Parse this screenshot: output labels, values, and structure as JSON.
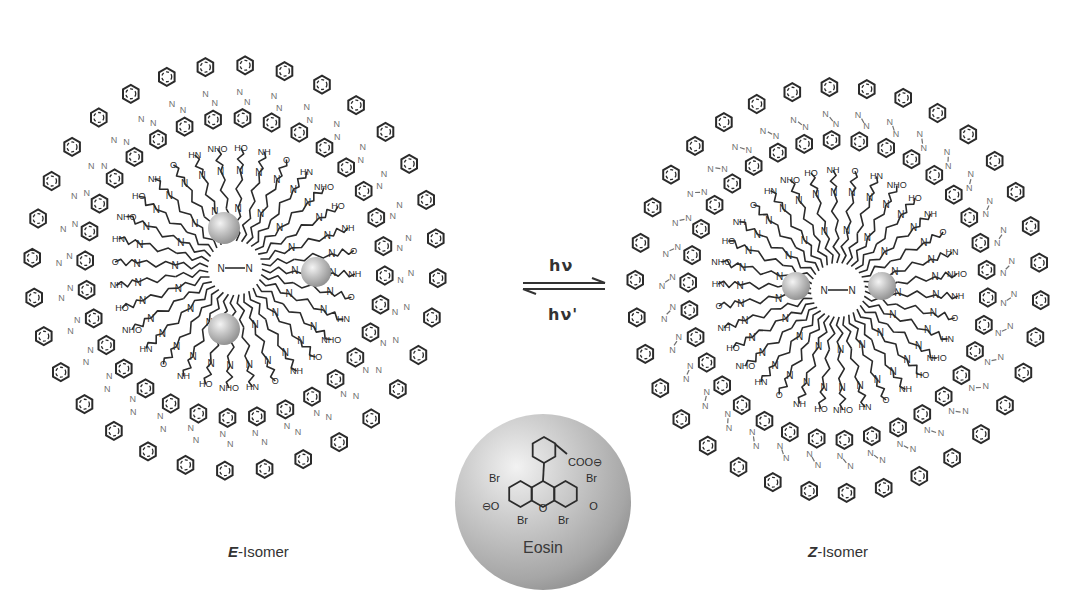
{
  "figure": {
    "background": "#ffffff",
    "ink_color": "#2b2b2b",
    "azo_color": "#707070",
    "sphere_color": "#b5b5b5"
  },
  "left_dendrimer": {
    "label_prefix": "E",
    "label_suffix": "-Isomer",
    "center": [
      235,
      268
    ],
    "arms": 32,
    "inner_radius": 60,
    "outer_radius": 215,
    "azo_style": "trans",
    "guest_spheres": [
      [
        224,
        228,
        16
      ],
      [
        316,
        272,
        15
      ],
      [
        224,
        329,
        16
      ]
    ]
  },
  "right_dendrimer": {
    "label_prefix": "Z",
    "label_suffix": "-Isomer",
    "center": [
      838,
      290
    ],
    "arms": 34,
    "inner_radius": 60,
    "outer_radius": 215,
    "azo_style": "cis",
    "guest_spheres": [
      [
        796,
        286,
        14
      ],
      [
        882,
        286,
        14
      ]
    ]
  },
  "equilibrium": {
    "forward_label": "hν",
    "reverse_label": "hν'"
  },
  "eosin": {
    "label": "Eosin",
    "substituents": {
      "top_right": "COO⊖",
      "br_upper_left": "Br",
      "br_upper_right": "Br",
      "br_lower_left": "Br",
      "br_lower_right": "Br",
      "phenolate": "⊖O",
      "ketone": "O",
      "ring_oxygen": "O"
    },
    "center": [
      543,
      502
    ],
    "radius": 88
  },
  "amide_labels": [
    "NH",
    "O",
    "HN",
    "NHO",
    "HO"
  ],
  "amine_label": "N",
  "azo_label": "N"
}
